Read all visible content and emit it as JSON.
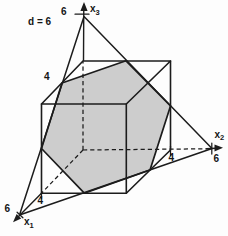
{
  "figure": {
    "plane_equation_label": "d = 6",
    "plane_d_value": 6,
    "cube_edge_value": 4,
    "axis_intercept_value": 6
  },
  "labels": {
    "x1": {
      "base": "x",
      "sub": "1",
      "max": "6",
      "cube": "4"
    },
    "x2": {
      "base": "x",
      "sub": "2",
      "max": "6",
      "cube": "4"
    },
    "x3": {
      "base": "x",
      "sub": "3",
      "max": "6",
      "cube": "4"
    }
  },
  "colors": {
    "line": "#1c1c1c",
    "hexagon_fill": "#cdcdcd",
    "background": "#fdfdfd"
  },
  "geometry": {
    "hexagon": "84.3,193.2 150,170 170.5,105.9 126,60.8 62,83 41.5,148.5",
    "triangle": "19.5,215 212,148.5 84,16.5",
    "cube_bottom_right_chain": "41.5,193.2 126.3,193.2 170.5,150 170.5,61",
    "cube_top_face": "83,61 41.5,104 126.3,104 170.5,61 83,61",
    "cube_left_vertical": "41.5,104 41.5,193.2",
    "cube_front_vertical": "126.3,104 126.3,193.2",
    "x3_hidden": "83,150 83,61.5",
    "x2_hidden": "83,150 206.5,148.8",
    "x1_hidden": "83,150 41.5,193.2",
    "x3_solid": "83.5,60.5 83.8,5",
    "x1_solid": "41.5,193.2 15.8,219.3",
    "x2_solid": "206.5,148.8 215.5,148.2",
    "x3_arrowhead": "84,2 80.4,11 87.6,11",
    "x2_arrowhead": "223,147.8 214.5,144.6 214.5,151.4",
    "x1_arrowhead": "13,222.3 21.2,218.4 16.6,214.0",
    "x3_tick_6": "75,14.2 89,14.2",
    "x2_tick_6": "211.8,143 211.8,154",
    "x2_tick_4": "170.5,146.5 170.5,155.5",
    "x1_tick_6": "17.1,212.2 22.9,217.8",
    "x1_tick_4": "41.5,193.2 41.5,198.5"
  }
}
